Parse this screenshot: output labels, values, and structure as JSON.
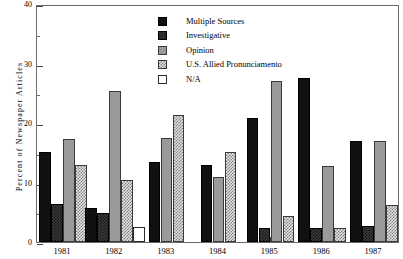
{
  "chart_data": {
    "type": "bar",
    "title": "",
    "xlabel": "",
    "ylabel": "Percent of Newspaper Articles",
    "ylim": [
      0,
      40
    ],
    "yticks": [
      0,
      10,
      20,
      30,
      40
    ],
    "ytick_labels": [
      "0",
      "10",
      "20",
      "30",
      "40"
    ],
    "yminor_ticks": [
      5,
      15,
      25,
      35
    ],
    "grid": false,
    "legend_position": "top-center",
    "categories": [
      "1981",
      "1982",
      "1983",
      "1984",
      "1985",
      "1986",
      "1987"
    ],
    "series": [
      {
        "name": "Multiple Sources",
        "swatch": "solid-black",
        "color": "#111111",
        "values": [
          15.1,
          5.8,
          13.5,
          13.0,
          20.8,
          27.5,
          16.9
        ]
      },
      {
        "name": "Investigative",
        "swatch": "dark-hatch",
        "color": "#3d3d3d",
        "values": [
          6.4,
          4.9,
          null,
          null,
          2.3,
          2.3,
          2.7
        ]
      },
      {
        "name": "Opinion",
        "swatch": "solid-gray",
        "color": "#9a9a9a",
        "values": [
          17.3,
          25.4,
          17.5,
          10.9,
          27.0,
          12.7,
          16.9
        ]
      },
      {
        "name": "U.S. Allied Pronunciamento",
        "swatch": "light-hatch",
        "color": "#e2e2e2",
        "values": [
          12.9,
          10.5,
          21.4,
          15.1,
          4.4,
          2.3,
          6.2
        ]
      },
      {
        "name": "N/A",
        "swatch": "white",
        "color": "#ffffff",
        "values": [
          null,
          2.5,
          null,
          null,
          null,
          null,
          null
        ]
      }
    ]
  },
  "axes": {
    "y_title": "Percent of Newspaper Articles"
  }
}
